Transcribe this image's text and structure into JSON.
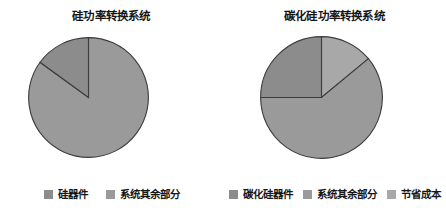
{
  "figure": {
    "background": "#ffffff",
    "panels": [
      "silicon",
      "sic"
    ]
  },
  "colors": {
    "device_dark": "#8c8c8c",
    "rest_of_system": "#9a9a9a",
    "savings_light": "#a8a8a8",
    "outline": "#3c3c3c",
    "text": "#151515"
  },
  "silicon_panel": {
    "title": "硅功率转换系统",
    "legend": [
      {
        "label": "硅器件",
        "color": "#8c8c8c",
        "swatch_name": "legend-swatch-silicon-device"
      },
      {
        "label": "系统其余部分",
        "color": "#9a9a9a",
        "swatch_name": "legend-swatch-rest-of-system"
      }
    ]
  },
  "sic_panel": {
    "title": "碳化硅功率转换系统",
    "legend": [
      {
        "label": "碳化硅器件",
        "color": "#8c8c8c",
        "swatch_name": "legend-swatch-sic-device"
      },
      {
        "label": "系统其余部分",
        "color": "#9a9a9a",
        "swatch_name": "legend-swatch-rest-of-system"
      },
      {
        "label": "节省成本",
        "color": "#a8a8a8",
        "swatch_name": "legend-swatch-cost-savings"
      }
    ]
  },
  "chart_data": [
    {
      "type": "pie",
      "title": "硅功率转换系统",
      "labels": [
        "硅器件",
        "系统其余部分"
      ],
      "values": [
        15,
        85
      ],
      "colors": [
        "#8c8c8c",
        "#9a9a9a"
      ],
      "start_angle_deg": 90,
      "direction": "counterclockwise",
      "legend_position": "bottom",
      "center": [
        88,
        97
      ],
      "radius": 60,
      "outline_color": "#3c3c3c",
      "data_labels": false
    },
    {
      "type": "pie",
      "title": "碳化硅功率转换系统",
      "labels": [
        "碳化硅器件",
        "系统其余部分",
        "节省成本"
      ],
      "values": [
        25,
        61,
        14
      ],
      "colors": [
        "#8c8c8c",
        "#9a9a9a",
        "#a8a8a8"
      ],
      "start_angle_deg": 90,
      "direction": "counterclockwise",
      "legend_position": "bottom",
      "center": [
        321,
        97
      ],
      "radius": 61,
      "outline_color": "#3c3c3c",
      "data_labels": false
    }
  ]
}
